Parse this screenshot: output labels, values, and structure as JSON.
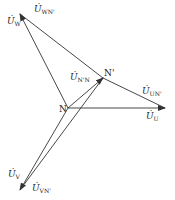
{
  "diagram": {
    "type": "phasor-diagram",
    "nodes": {
      "N": {
        "label": "N",
        "x": 68,
        "y": 108
      },
      "N_prime": {
        "label": "N'",
        "x": 103,
        "y": 78
      }
    },
    "phasors": [
      {
        "id": "U_U",
        "base": "U",
        "sub": "U",
        "from": "N",
        "to": [
          165,
          108
        ]
      },
      {
        "id": "U_V",
        "base": "U",
        "sub": "V",
        "from": "N",
        "to": [
          20,
          190
        ]
      },
      {
        "id": "U_W",
        "base": "U",
        "sub": "W",
        "from": "N",
        "to": [
          20,
          14
        ]
      },
      {
        "id": "U_N'N",
        "base": "U",
        "sub": "N'N",
        "from": "N",
        "to": "N_prime"
      },
      {
        "id": "U_UN'",
        "base": "U",
        "sub": "UN'",
        "from": "N_prime",
        "to": [
          165,
          108
        ]
      },
      {
        "id": "U_VN'",
        "base": "U",
        "sub": "VN'",
        "from": "N_prime",
        "to": [
          20,
          190
        ]
      },
      {
        "id": "U_WN'",
        "base": "U",
        "sub": "WN'",
        "from": "N_prime",
        "to": [
          20,
          14
        ]
      }
    ],
    "labels": {
      "U_W": {
        "base": "U̇",
        "sub": "W"
      },
      "U_WN": {
        "base": "U̇",
        "sub": "WN'"
      },
      "U_NN": {
        "base": "U̇",
        "sub": "N'N"
      },
      "U_UN": {
        "base": "U̇",
        "sub": "UN'"
      },
      "U_U": {
        "base": "U̇",
        "sub": "U"
      },
      "U_V": {
        "base": "U̇",
        "sub": "V"
      },
      "U_VN": {
        "base": "U̇",
        "sub": "VN'"
      },
      "N": "N",
      "N_prime": "N'"
    },
    "colors": {
      "line": "#333333",
      "background": "#ffffff"
    }
  }
}
